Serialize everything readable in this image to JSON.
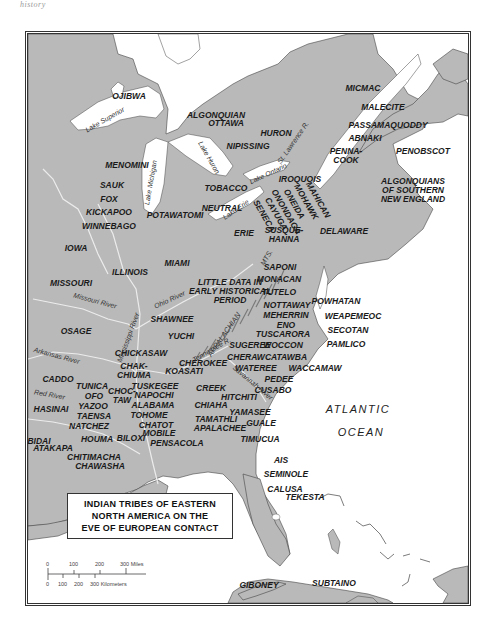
{
  "header_text": "history",
  "map": {
    "title_lines": [
      "INDIAN TRIBES OF EASTERN",
      "NORTH AMERICA ON THE",
      "EVE OF EUROPEAN CONTACT"
    ],
    "colors": {
      "land": "#b9b9b9",
      "water": "#ffffff",
      "river": "#e8e8e8",
      "border": "#333333",
      "mountains": "#8a8a8a"
    },
    "tribes": [
      {
        "id": "ojibwa",
        "label": "OJIBWA"
      },
      {
        "id": "algonquian",
        "label": "ALGONQUIAN"
      },
      {
        "id": "micmac",
        "label": "MICMAC"
      },
      {
        "id": "malecite",
        "label": "MALECITE"
      },
      {
        "id": "passamaquoddy",
        "label": "PASSAMAQUODDY"
      },
      {
        "id": "abnaki",
        "label": "ABNAKI"
      },
      {
        "id": "pennacook",
        "label": "PENNA-\nCOOK"
      },
      {
        "id": "penobscot",
        "label": "PENOBSCOT"
      },
      {
        "id": "ottawa",
        "label": "OTTAWA"
      },
      {
        "id": "huron",
        "label": "HURON"
      },
      {
        "id": "nipissing",
        "label": "NIPISSING"
      },
      {
        "id": "menomini",
        "label": "MENOMINI"
      },
      {
        "id": "sauk",
        "label": "SAUK"
      },
      {
        "id": "fox",
        "label": "FOX"
      },
      {
        "id": "kickapoo",
        "label": "KICKAPOO"
      },
      {
        "id": "winnebago",
        "label": "WINNEBAGO"
      },
      {
        "id": "potawatomi",
        "label": "POTAWATOMI"
      },
      {
        "id": "tobacco",
        "label": "TOBACCO"
      },
      {
        "id": "neutral",
        "label": "NEUTRAL"
      },
      {
        "id": "iroquois",
        "label": "IROQUOIS"
      },
      {
        "id": "mahican",
        "label": "MAHICAN"
      },
      {
        "id": "mohawk",
        "label": "MOHAWK"
      },
      {
        "id": "oneida",
        "label": "ONEIDA"
      },
      {
        "id": "onondaga",
        "label": "ONONDAGA"
      },
      {
        "id": "cayuga",
        "label": "CAYUGA"
      },
      {
        "id": "seneca",
        "label": "SENECA"
      },
      {
        "id": "algonquians-se",
        "label": "ALGONQUIANS\nOF SOUTHERN\nNEW ENGLAND"
      },
      {
        "id": "erie",
        "label": "ERIE"
      },
      {
        "id": "susquehanna",
        "label": "SUSQUE-\nHANNA"
      },
      {
        "id": "delaware",
        "label": "DELAWARE"
      },
      {
        "id": "iowa",
        "label": "IOWA"
      },
      {
        "id": "illinois",
        "label": "ILLINOIS"
      },
      {
        "id": "miami",
        "label": "MIAMI"
      },
      {
        "id": "missouri",
        "label": "MISSOURI"
      },
      {
        "id": "little-data",
        "label": "LITTLE DATA IN\nEARLY HISTORICAL\nPERIOD"
      },
      {
        "id": "saponi",
        "label": "SAPONI"
      },
      {
        "id": "monacan",
        "label": "MONACAN"
      },
      {
        "id": "tutelo",
        "label": "TUTELO"
      },
      {
        "id": "powhatan",
        "label": "POWHATAN"
      },
      {
        "id": "nottaway",
        "label": "NOTTAWAY"
      },
      {
        "id": "meherrin",
        "label": "MEHERRIN"
      },
      {
        "id": "eno",
        "label": "ENO"
      },
      {
        "id": "tuscarora",
        "label": "TUSCARORA"
      },
      {
        "id": "weapemeoc",
        "label": "WEAPEMEOC"
      },
      {
        "id": "secotan",
        "label": "SECOTAN"
      },
      {
        "id": "pamlico",
        "label": "PAMLICO"
      },
      {
        "id": "woccon",
        "label": "WOCCON"
      },
      {
        "id": "sugeree",
        "label": "SUGEREE"
      },
      {
        "id": "cheraw",
        "label": "CHERAW"
      },
      {
        "id": "catawba",
        "label": "CATAWBA"
      },
      {
        "id": "waccamaw",
        "label": "WACCAMAW"
      },
      {
        "id": "wateree",
        "label": "WATEREE"
      },
      {
        "id": "pedee",
        "label": "PEDEE"
      },
      {
        "id": "cusabo",
        "label": "CUSABO"
      },
      {
        "id": "shawnee",
        "label": "SHAWNEE"
      },
      {
        "id": "osage",
        "label": "OSAGE"
      },
      {
        "id": "yuchi",
        "label": "YUCHI"
      },
      {
        "id": "chickasaw",
        "label": "CHICKASAW"
      },
      {
        "id": "cherokee",
        "label": "CHEROKEE"
      },
      {
        "id": "chakchiuma",
        "label": "CHAK-\nCHIUMA"
      },
      {
        "id": "koasati",
        "label": "KOASATI"
      },
      {
        "id": "caddo",
        "label": "CADDO"
      },
      {
        "id": "tunica",
        "label": "TUNICA"
      },
      {
        "id": "ofo",
        "label": "OFO"
      },
      {
        "id": "yazoo",
        "label": "YAZOO"
      },
      {
        "id": "choctaw",
        "label": "CHOC-\nTAW"
      },
      {
        "id": "tuskegee",
        "label": "TUSKEGEE"
      },
      {
        "id": "napochi",
        "label": "NAPOCHI"
      },
      {
        "id": "alabama",
        "label": "ALABAMA"
      },
      {
        "id": "tohome",
        "label": "TOHOME"
      },
      {
        "id": "creek",
        "label": "CREEK"
      },
      {
        "id": "hitchiti",
        "label": "HITCHITI"
      },
      {
        "id": "chiaha",
        "label": "CHIAHA"
      },
      {
        "id": "yamasee",
        "label": "YAMASEE"
      },
      {
        "id": "chatot",
        "label": "CHATOT"
      },
      {
        "id": "tamathli",
        "label": "TAMATHLI"
      },
      {
        "id": "mobile",
        "label": "MOBILE"
      },
      {
        "id": "apalachee",
        "label": "APALACHEE"
      },
      {
        "id": "guale",
        "label": "GUALE"
      },
      {
        "id": "hasinai",
        "label": "HASINAI"
      },
      {
        "id": "taensa",
        "label": "TAENSA"
      },
      {
        "id": "natchez",
        "label": "NATCHEZ"
      },
      {
        "id": "houma",
        "label": "HOUMA"
      },
      {
        "id": "biloxi",
        "label": "BILOXI"
      },
      {
        "id": "pensacola",
        "label": "PENSACOLA"
      },
      {
        "id": "bidai",
        "label": "BIDAI"
      },
      {
        "id": "atakapa",
        "label": "ATAKAPA"
      },
      {
        "id": "chitimacha",
        "label": "CHITIMACHA"
      },
      {
        "id": "chawasha",
        "label": "CHAWASHA"
      },
      {
        "id": "timucua",
        "label": "TIMUCUA"
      },
      {
        "id": "ais",
        "label": "AIS"
      },
      {
        "id": "seminole",
        "label": "SEMINOLE"
      },
      {
        "id": "calusa",
        "label": "CALUSA"
      },
      {
        "id": "tekesta",
        "label": "TEKESTA"
      },
      {
        "id": "giboney",
        "label": "GIBONEY"
      },
      {
        "id": "subtaino",
        "label": "SUBTAINO"
      }
    ],
    "water_labels": {
      "lake_superior": "Lake Superior",
      "lake_michigan": "Lake Michigan",
      "lake_huron": "Lake Huron",
      "lake_ontario": "Lake Ontario",
      "lake_erie": "Lake Erie",
      "st_lawrence": "St. Lawrence R.",
      "missouri_river": "Missouri River",
      "ohio_river": "Ohio River",
      "mississippi_river": "Mississippi River",
      "arkansas_river": "Arkansas River",
      "red_river": "Red River",
      "tennessee_river": "Tennessee R.",
      "savannah_river": "Savannah River"
    },
    "physical_labels": {
      "appalachian": "APPALACHIAN",
      "mts": "MTS."
    },
    "ocean_label": [
      "ATLANTIC",
      "OCEAN"
    ],
    "scale": {
      "miles_ticks": [
        "0",
        "100",
        "200",
        "300 Miles"
      ],
      "km_ticks": [
        "0",
        "100",
        "200",
        "300 Kilometers"
      ]
    }
  }
}
